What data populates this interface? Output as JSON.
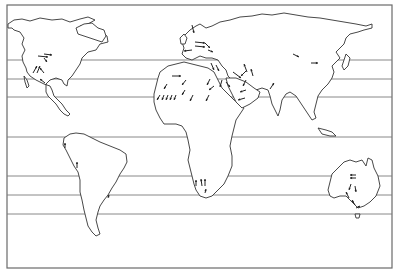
{
  "map": {
    "title": "",
    "colors": {
      "background": "#ffffff",
      "coast": "#333333",
      "lines": "#7a7a7a",
      "arrows": "#222222"
    },
    "frame": {
      "x": 7,
      "y": 5,
      "width": 385,
      "height": 263
    },
    "latitude_lines_y": [
      60,
      79,
      97,
      137,
      176,
      195,
      214
    ],
    "arrows": [
      {
        "region": "north-america",
        "x1": 38,
        "y1": 56,
        "x2": 48,
        "y2": 57
      },
      {
        "region": "north-america",
        "x1": 44,
        "y1": 54,
        "x2": 52,
        "y2": 55
      },
      {
        "region": "north-america",
        "x1": 44,
        "y1": 58,
        "x2": 47,
        "y2": 62
      },
      {
        "region": "north-america",
        "x1": 33,
        "y1": 73,
        "x2": 37,
        "y2": 66
      },
      {
        "region": "north-america",
        "x1": 37,
        "y1": 73,
        "x2": 40,
        "y2": 66
      },
      {
        "region": "north-america",
        "x1": 44,
        "y1": 73,
        "x2": 40,
        "y2": 68
      },
      {
        "region": "north-america",
        "x1": 45,
        "y1": 83,
        "x2": 40,
        "y2": 79
      },
      {
        "region": "europe",
        "x1": 192,
        "y1": 25,
        "x2": 194,
        "y2": 33
      },
      {
        "region": "europe",
        "x1": 195,
        "y1": 42,
        "x2": 205,
        "y2": 43
      },
      {
        "region": "europe",
        "x1": 195,
        "y1": 46,
        "x2": 205,
        "y2": 47
      },
      {
        "region": "europe",
        "x1": 192,
        "y1": 50,
        "x2": 184,
        "y2": 51
      },
      {
        "region": "europe",
        "x1": 208,
        "y1": 50,
        "x2": 213,
        "y2": 52
      },
      {
        "region": "sahara",
        "x1": 172,
        "y1": 76,
        "x2": 181,
        "y2": 76
      },
      {
        "region": "sahara",
        "x1": 167,
        "y1": 84,
        "x2": 164,
        "y2": 89
      },
      {
        "region": "sahara",
        "x1": 186,
        "y1": 80,
        "x2": 182,
        "y2": 85
      },
      {
        "region": "sahara",
        "x1": 185,
        "y1": 90,
        "x2": 182,
        "y2": 95
      },
      {
        "region": "sahara",
        "x1": 160,
        "y1": 95,
        "x2": 157,
        "y2": 100
      },
      {
        "region": "sahara",
        "x1": 164,
        "y1": 95,
        "x2": 162,
        "y2": 100
      },
      {
        "region": "sahara",
        "x1": 168,
        "y1": 95,
        "x2": 166,
        "y2": 100
      },
      {
        "region": "sahara",
        "x1": 172,
        "y1": 95,
        "x2": 170,
        "y2": 100
      },
      {
        "region": "sahara",
        "x1": 176,
        "y1": 95,
        "x2": 174,
        "y2": 100
      },
      {
        "region": "sahara",
        "x1": 193,
        "y1": 95,
        "x2": 190,
        "y2": 101
      },
      {
        "region": "sahara",
        "x1": 209,
        "y1": 95,
        "x2": 206,
        "y2": 101
      },
      {
        "region": "sahara",
        "x1": 210,
        "y1": 79,
        "x2": 207,
        "y2": 85
      },
      {
        "region": "sahara",
        "x1": 214,
        "y1": 86,
        "x2": 209,
        "y2": 90
      },
      {
        "region": "middle-east",
        "x1": 205,
        "y1": 43,
        "x2": 210,
        "y2": 48
      },
      {
        "region": "middle-east",
        "x1": 211,
        "y1": 63,
        "x2": 214,
        "y2": 70
      },
      {
        "region": "middle-east",
        "x1": 216,
        "y1": 65,
        "x2": 219,
        "y2": 71
      },
      {
        "region": "middle-east",
        "x1": 222,
        "y1": 80,
        "x2": 220,
        "y2": 87
      },
      {
        "region": "middle-east",
        "x1": 226,
        "y1": 82,
        "x2": 230,
        "y2": 87
      },
      {
        "region": "middle-east",
        "x1": 233,
        "y1": 72,
        "x2": 241,
        "y2": 78
      },
      {
        "region": "middle-east",
        "x1": 246,
        "y1": 71,
        "x2": 241,
        "y2": 76
      },
      {
        "region": "middle-east",
        "x1": 246,
        "y1": 90,
        "x2": 240,
        "y2": 92
      },
      {
        "region": "middle-east",
        "x1": 245,
        "y1": 98,
        "x2": 238,
        "y2": 100
      },
      {
        "region": "middle-east",
        "x1": 247,
        "y1": 72,
        "x2": 244,
        "y2": 64
      },
      {
        "region": "middle-east",
        "x1": 253,
        "y1": 76,
        "x2": 251,
        "y2": 69
      },
      {
        "region": "middle-east",
        "x1": 246,
        "y1": 80,
        "x2": 243,
        "y2": 86
      },
      {
        "region": "india",
        "x1": 270,
        "y1": 89,
        "x2": 274,
        "y2": 83
      },
      {
        "region": "asia",
        "x1": 293,
        "y1": 54,
        "x2": 299,
        "y2": 57
      },
      {
        "region": "asia",
        "x1": 311,
        "y1": 63,
        "x2": 318,
        "y2": 63
      },
      {
        "region": "south-america",
        "x1": 65,
        "y1": 148,
        "x2": 65,
        "y2": 143
      },
      {
        "region": "south-america",
        "x1": 77,
        "y1": 168,
        "x2": 77,
        "y2": 162
      },
      {
        "region": "south-america",
        "x1": 108,
        "y1": 198,
        "x2": 109,
        "y2": 195
      },
      {
        "region": "southern-africa",
        "x1": 196,
        "y1": 186,
        "x2": 196,
        "y2": 180
      },
      {
        "region": "southern-africa",
        "x1": 202,
        "y1": 186,
        "x2": 201,
        "y2": 179
      },
      {
        "region": "southern-africa",
        "x1": 205,
        "y1": 186,
        "x2": 205,
        "y2": 179
      },
      {
        "region": "southern-africa",
        "x1": 205,
        "y1": 193,
        "x2": 206,
        "y2": 189
      },
      {
        "region": "australia",
        "x1": 356,
        "y1": 175,
        "x2": 350,
        "y2": 175
      },
      {
        "region": "australia",
        "x1": 356,
        "y1": 178,
        "x2": 350,
        "y2": 178
      },
      {
        "region": "australia",
        "x1": 351,
        "y1": 184,
        "x2": 349,
        "y2": 190
      },
      {
        "region": "australia",
        "x1": 355,
        "y1": 186,
        "x2": 356,
        "y2": 192
      },
      {
        "region": "australia",
        "x1": 349,
        "y1": 198,
        "x2": 346,
        "y2": 192
      },
      {
        "region": "australia",
        "x1": 355,
        "y1": 205,
        "x2": 352,
        "y2": 200
      },
      {
        "region": "australia",
        "x1": 356,
        "y1": 208,
        "x2": 360,
        "y2": 206
      }
    ]
  }
}
